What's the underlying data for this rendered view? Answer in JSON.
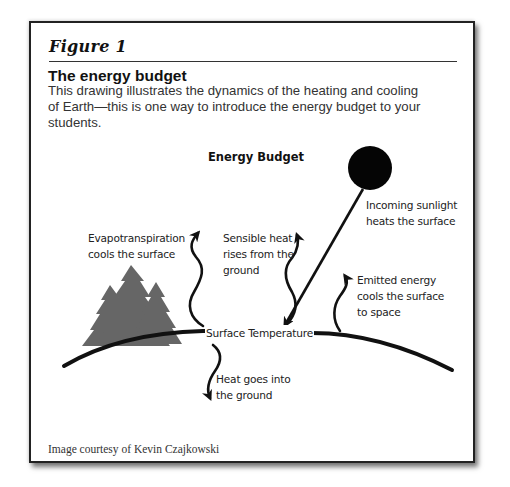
{
  "figure": {
    "label": "Figure 1",
    "title": "The energy budget",
    "description_lines": [
      "This drawing illustrates the dynamics of the heating and cooling",
      "of Earth—this is one way to introduce the energy budget to your",
      "students."
    ],
    "credit": "Image courtesy of Kevin Czajkowski"
  },
  "diagram": {
    "title": "Energy Budget",
    "center_label": "Surface Temperature",
    "labels": {
      "evapotranspiration": [
        "Evapotranspiration",
        "cools the surface"
      ],
      "sensible_heat": [
        "Sensible heat",
        "rises from the",
        "ground"
      ],
      "incoming_sunlight": [
        "Incoming sunlight",
        "heats the surface"
      ],
      "emitted_energy": [
        "Emitted energy",
        "cools the surface",
        "to space"
      ],
      "ground_heat": [
        "Heat goes into",
        "the ground"
      ]
    },
    "icons": {
      "sun": "sun-icon",
      "trees": "tree-icon",
      "earth_surface": "earth-curve"
    },
    "colors": {
      "ink": "#111111",
      "trees": "#666666",
      "border": "#222222"
    }
  }
}
